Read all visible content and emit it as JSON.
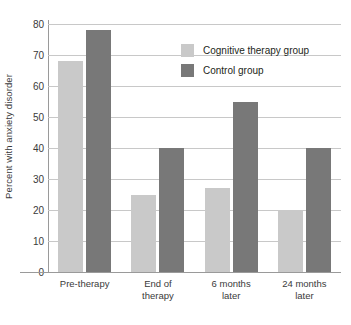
{
  "chart_data": {
    "type": "bar",
    "title": "",
    "xlabel": "",
    "ylabel": "Percent with anxiety disorder",
    "ylim": [
      0,
      80
    ],
    "ytick_step": 10,
    "yticks": [
      0,
      10,
      20,
      30,
      40,
      50,
      60,
      70,
      80
    ],
    "grid": true,
    "legend_position": "top-right",
    "categories": [
      "Pre-therapy",
      "End of\ntherapy",
      "6 months\nlater",
      "24 months\nlater"
    ],
    "category_lines": [
      [
        "Pre-therapy"
      ],
      [
        "End of",
        "therapy"
      ],
      [
        "6 months",
        "later"
      ],
      [
        "24 months",
        "later"
      ]
    ],
    "series": [
      {
        "name": "Cognitive therapy group",
        "color": "#c9c9c9",
        "values": [
          68,
          25,
          27,
          20
        ]
      },
      {
        "name": "Control group",
        "color": "#787878",
        "values": [
          78,
          40,
          55,
          40
        ]
      }
    ]
  },
  "legend": {
    "items": [
      {
        "label": "Cognitive therapy group"
      },
      {
        "label": "Control group"
      }
    ]
  },
  "axis": {
    "y_title": "Percent with anxiety disorder"
  },
  "colors": {
    "light_bar": "#c9c9c9",
    "dark_bar": "#787878",
    "gridline": "#c8c8c8",
    "axis": "#9a9a9a",
    "text": "#3a3a3a"
  }
}
